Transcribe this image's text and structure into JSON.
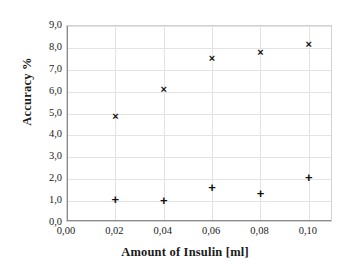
{
  "chart_data": {
    "type": "scatter",
    "title": "",
    "xlabel": "Amount of Insulin [ml]",
    "ylabel": "Accuracy %",
    "xlim": [
      0.0,
      0.11
    ],
    "ylim": [
      0.0,
      9.0
    ],
    "grid": true,
    "legend": "none",
    "x": [
      0.02,
      0.04,
      0.06,
      0.08,
      0.1
    ],
    "xtick_labels": [
      "0,00",
      "0,02",
      "0,04",
      "0,06",
      "0,08",
      "0,10"
    ],
    "xtick_values": [
      0.0,
      0.02,
      0.04,
      0.06,
      0.08,
      0.1
    ],
    "ytick_labels": [
      "0,0",
      "1,0",
      "2,0",
      "3,0",
      "4,0",
      "5,0",
      "6,0",
      "7,0",
      "8,0",
      "9,0"
    ],
    "ytick_values": [
      0,
      1,
      2,
      3,
      4,
      5,
      6,
      7,
      8,
      9
    ],
    "series": [
      {
        "name": "upper-series",
        "marker": "x",
        "color": "#111111",
        "values": [
          4.9,
          6.1,
          7.55,
          7.8,
          8.2
        ]
      },
      {
        "name": "lower-series",
        "marker": "+",
        "color": "#111111",
        "values": [
          1.1,
          1.05,
          1.65,
          1.35,
          2.1
        ]
      }
    ]
  },
  "glyphs": {
    "cross": "×",
    "plus": "+"
  }
}
